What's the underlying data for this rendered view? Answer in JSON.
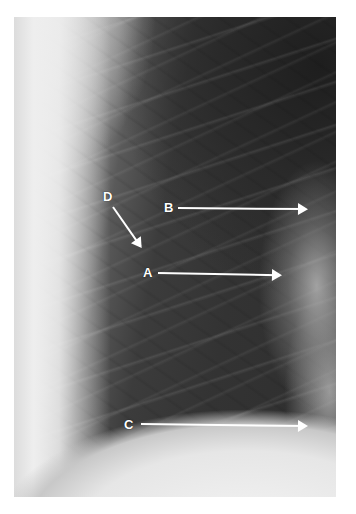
{
  "image": {
    "description": "Lateral-region chest radiograph of lung field with labeled arrows",
    "labels": [
      {
        "id": "A",
        "text": "A",
        "target": "hilar region vessel"
      },
      {
        "id": "B",
        "text": "B",
        "target": "upper hilum"
      },
      {
        "id": "C",
        "text": "C",
        "target": "cardiac/diaphragm border"
      },
      {
        "id": "D",
        "text": "D",
        "target": "lung parenchyma"
      }
    ],
    "colors": {
      "arrow": "#ffffff",
      "label": "#ffffff",
      "background": "#ffffff"
    }
  }
}
